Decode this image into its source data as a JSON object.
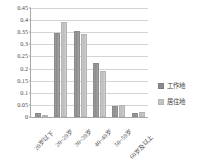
{
  "chart_data": {
    "type": "bar",
    "title": "",
    "subtitle": "",
    "xlabel": "",
    "ylabel": "",
    "grid": true,
    "legend_position": "right",
    "ylim": [
      0,
      0.45
    ],
    "ytick_labels": [
      "0",
      "0.05",
      "0.1",
      "0.15",
      "0.2",
      "0.25",
      "0.3",
      "0.35",
      "0.4",
      "0.45"
    ],
    "ytick_values": [
      0,
      0.05,
      0.1,
      0.15,
      0.2,
      0.25,
      0.3,
      0.35,
      0.4,
      0.45
    ],
    "categories": [
      "20岁以下",
      "20~29岁",
      "30~39岁",
      "40~49岁",
      "50~59岁",
      "60岁及以上"
    ],
    "series": [
      {
        "name": "工作地",
        "color": "#8c8c8c",
        "values": [
          0.016,
          0.347,
          0.357,
          0.222,
          0.046,
          0.016
        ]
      },
      {
        "name": "居住地",
        "color": "#c4c4c4",
        "values": [
          0.002,
          0.394,
          0.342,
          0.19,
          0.049,
          0.02
        ]
      }
    ]
  },
  "legend": {
    "items": [
      {
        "label": "工作地"
      },
      {
        "label": "居住地"
      }
    ]
  }
}
